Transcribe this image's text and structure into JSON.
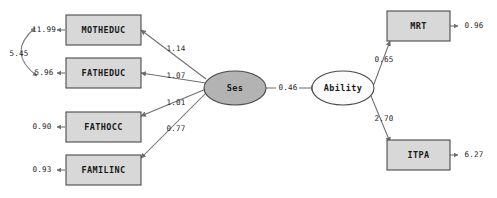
{
  "diagram": {
    "type": "structural-equation-model-path-diagram",
    "background_color": "#ffffff",
    "observed_node_fill": "#d8d8d8",
    "latent_exogenous_fill": "#b3b3b3",
    "latent_endogenous_fill": "#fbfbfb",
    "edge_color": "#6e6e6e",
    "observed_variables": [
      {
        "id": "motheduc",
        "label": "MOTHEDUC"
      },
      {
        "id": "fatheduc",
        "label": "FATHEDUC"
      },
      {
        "id": "fathocc",
        "label": "FATHOCC"
      },
      {
        "id": "familinc",
        "label": "FAMILINC"
      },
      {
        "id": "mrt",
        "label": "MRT"
      },
      {
        "id": "itpa",
        "label": "ITPA"
      }
    ],
    "latent_variables": [
      {
        "id": "ses",
        "label": "Ses"
      },
      {
        "id": "ability",
        "label": "Ability"
      }
    ],
    "loadings": [
      {
        "from": "ses",
        "to": "motheduc",
        "value": "1.14"
      },
      {
        "from": "ses",
        "to": "fatheduc",
        "value": "1.07"
      },
      {
        "from": "ses",
        "to": "fathocc",
        "value": "1.01"
      },
      {
        "from": "ses",
        "to": "familinc",
        "value": "0.77"
      },
      {
        "from": "ability",
        "to": "mrt",
        "value": "0.65"
      },
      {
        "from": "ability",
        "to": "itpa",
        "value": "2.70"
      }
    ],
    "structural_paths": [
      {
        "from": "ses",
        "to": "ability",
        "value": "0.46"
      }
    ],
    "residual_variances": [
      {
        "on": "motheduc",
        "value": "11.99"
      },
      {
        "on": "fatheduc",
        "value": "5.96"
      },
      {
        "on": "fathocc",
        "value": "0.90"
      },
      {
        "on": "familinc",
        "value": "0.93"
      },
      {
        "on": "mrt",
        "value": "0.96"
      },
      {
        "on": "itpa",
        "value": "6.27"
      }
    ],
    "covariances": [
      {
        "between": [
          "motheduc",
          "fatheduc"
        ],
        "value": "5.45"
      }
    ]
  }
}
